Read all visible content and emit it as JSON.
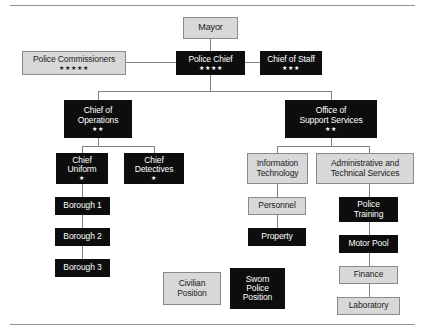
{
  "chart": {
    "type": "organizational-chart",
    "colors": {
      "sworn_fill": "#0d0d0d",
      "sworn_text": "#ffffff",
      "civilian_fill": "#d8d8d8",
      "civilian_text": "#1a1a1a",
      "connector": "#7d8288",
      "rule": "#8d9298",
      "background": "#ffffff"
    },
    "legend": [
      {
        "label": "Civilian\nPosition",
        "type": "civilian"
      },
      {
        "label": "Sworn\nPolice\nPosition",
        "type": "sworn"
      }
    ],
    "nodes": [
      {
        "id": "mayor",
        "label": "Mayor",
        "type": "civilian",
        "stars": ""
      },
      {
        "id": "commissioners",
        "label": "Police Commissioners",
        "type": "civilian",
        "stars": "★★★★★"
      },
      {
        "id": "police-chief",
        "label": "Police Chief",
        "type": "sworn",
        "stars": "★★★★"
      },
      {
        "id": "chief-staff",
        "label": "Chief of Staff",
        "type": "sworn",
        "stars": "★★★"
      },
      {
        "id": "chief-ops",
        "label": "Chief of\nOperations",
        "type": "sworn",
        "stars": "★★"
      },
      {
        "id": "support-svcs",
        "label": "Office of\nSupport Services",
        "type": "sworn",
        "stars": "★★"
      },
      {
        "id": "chief-uniform",
        "label": "Chief\nUniform",
        "type": "sworn",
        "stars": "★"
      },
      {
        "id": "chief-detect",
        "label": "Chief\nDetectives",
        "type": "sworn",
        "stars": "★"
      },
      {
        "id": "borough-1",
        "label": "Borough 1",
        "type": "sworn",
        "stars": ""
      },
      {
        "id": "borough-2",
        "label": "Borough 2",
        "type": "sworn",
        "stars": ""
      },
      {
        "id": "borough-3",
        "label": "Borough 3",
        "type": "sworn",
        "stars": ""
      },
      {
        "id": "info-tech",
        "label": "Information\nTechnology",
        "type": "civilian",
        "stars": ""
      },
      {
        "id": "personnel",
        "label": "Personnel",
        "type": "civilian",
        "stars": ""
      },
      {
        "id": "property",
        "label": "Property",
        "type": "sworn",
        "stars": ""
      },
      {
        "id": "admin-tech",
        "label": "Administrative and\nTechnical Services",
        "type": "civilian",
        "stars": ""
      },
      {
        "id": "police-train",
        "label": "Police\nTraining",
        "type": "sworn",
        "stars": ""
      },
      {
        "id": "motor-pool",
        "label": "Motor Pool",
        "type": "sworn",
        "stars": ""
      },
      {
        "id": "finance",
        "label": "Finance",
        "type": "civilian",
        "stars": ""
      },
      {
        "id": "laboratory",
        "label": "Laboratory",
        "type": "civilian",
        "stars": ""
      }
    ],
    "edges": [
      {
        "from": "mayor",
        "to": "police-chief"
      },
      {
        "from": "police-chief",
        "to": "commissioners"
      },
      {
        "from": "police-chief",
        "to": "chief-staff"
      },
      {
        "from": "police-chief",
        "to": "chief-ops"
      },
      {
        "from": "police-chief",
        "to": "support-svcs"
      },
      {
        "from": "chief-ops",
        "to": "chief-uniform"
      },
      {
        "from": "chief-ops",
        "to": "chief-detect"
      },
      {
        "from": "chief-uniform",
        "to": "borough-1"
      },
      {
        "from": "borough-1",
        "to": "borough-2"
      },
      {
        "from": "borough-2",
        "to": "borough-3"
      },
      {
        "from": "support-svcs",
        "to": "info-tech"
      },
      {
        "from": "support-svcs",
        "to": "admin-tech"
      },
      {
        "from": "info-tech",
        "to": "personnel"
      },
      {
        "from": "personnel",
        "to": "property"
      },
      {
        "from": "admin-tech",
        "to": "police-train"
      },
      {
        "from": "police-train",
        "to": "motor-pool"
      },
      {
        "from": "motor-pool",
        "to": "finance"
      },
      {
        "from": "finance",
        "to": "laboratory"
      }
    ]
  }
}
